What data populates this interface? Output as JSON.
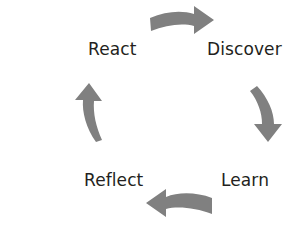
{
  "diagram": {
    "direction": "clockwise",
    "background_color": "#ffffff",
    "arrow_color": "#808080",
    "label_color": "#231f20",
    "nodes": [
      {
        "id": "discover",
        "label": "Discover",
        "position": "top-right"
      },
      {
        "id": "learn",
        "label": "Learn",
        "position": "bottom-right"
      },
      {
        "id": "reflect",
        "label": "Reflect",
        "position": "bottom-left"
      },
      {
        "id": "react",
        "label": "React",
        "position": "top-left"
      }
    ],
    "arrows": [
      {
        "id": "arrow-top",
        "from": "react",
        "to": "discover",
        "points": "right"
      },
      {
        "id": "arrow-right",
        "from": "discover",
        "to": "learn",
        "points": "down"
      },
      {
        "id": "arrow-bottom",
        "from": "learn",
        "to": "reflect",
        "points": "left"
      },
      {
        "id": "arrow-left",
        "from": "reflect",
        "to": "react",
        "points": "up"
      }
    ]
  }
}
